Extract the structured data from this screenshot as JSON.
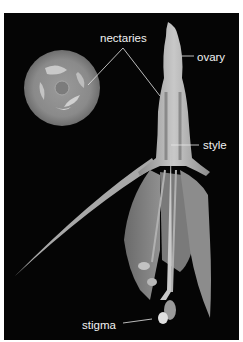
{
  "figure": {
    "background_color": "#050505",
    "label_color": "#f2f2f2",
    "labels": [
      {
        "id": "nectaries",
        "text": "nectaries"
      },
      {
        "id": "ovary",
        "text": "ovary"
      },
      {
        "id": "style",
        "text": "style"
      },
      {
        "id": "stigma",
        "text": "stigma"
      }
    ]
  }
}
